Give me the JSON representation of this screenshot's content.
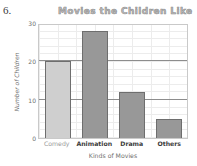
{
  "worksheet": {
    "item_number": "6."
  },
  "chart_data": {
    "type": "bar",
    "title": "Movies the Children Like",
    "xlabel": "Kinds of Movies",
    "ylabel": "Number of Children",
    "categories": [
      "Comedy",
      "Animation",
      "Drama",
      "Others"
    ],
    "values": [
      20,
      28,
      12,
      5
    ],
    "ylim": [
      0,
      30
    ],
    "yticks": [
      "0",
      "10",
      "20",
      "30"
    ],
    "ytick_values": [
      0,
      10,
      20,
      30
    ],
    "grid": true,
    "legend": null,
    "bar_colors": [
      "#cfcfcf",
      "#989898",
      "#989898",
      "#989898"
    ],
    "bar_outline": "#6e6e6e"
  },
  "colors": {
    "plot_border": "#c9c9c9",
    "grid_minor": "#ececec",
    "grid_major": "#8d8d8d",
    "title_text": "#b9b9b9",
    "axis_text": "#6f6f6f",
    "page_background": "#ffffff"
  }
}
